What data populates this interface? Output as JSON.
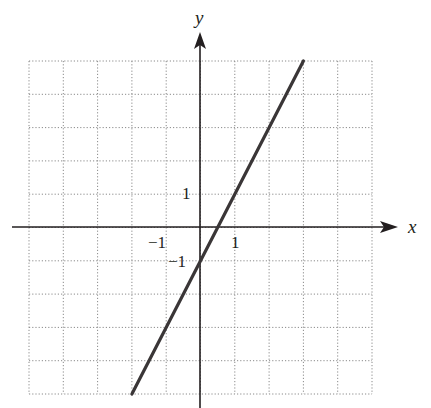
{
  "chart_data": {
    "type": "line",
    "title": "",
    "xlabel": "x",
    "ylabel": "y",
    "xlim": [
      -5,
      5
    ],
    "ylim": [
      -5,
      5
    ],
    "grid": true,
    "grid_style": "dotted",
    "tick_labels": {
      "x": [
        {
          "value": -1,
          "label": "−1"
        },
        {
          "value": 1,
          "label": "1"
        }
      ],
      "y": [
        {
          "value": 1,
          "label": "1"
        },
        {
          "value": -1,
          "label": "−1"
        }
      ]
    },
    "series": [
      {
        "name": "y = 2x - 1",
        "equation": "y = 2x - 1",
        "x": [
          -2,
          3
        ],
        "y": [
          -5,
          5
        ]
      }
    ],
    "legend": null
  },
  "labels": {
    "x_axis": "x",
    "y_axis": "y",
    "x_tick_neg1": "−1",
    "x_tick_1": "1",
    "y_tick_1": "1",
    "y_tick_neg1": "−1"
  },
  "colors": {
    "line": "#3a3637",
    "axis": "#231f20",
    "grid": "#8a8a8a"
  }
}
